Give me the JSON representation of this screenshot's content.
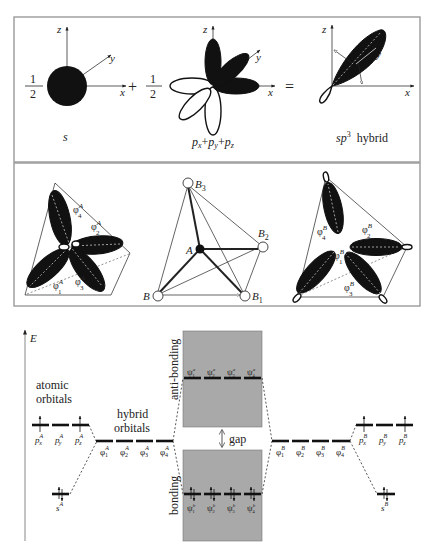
{
  "top_panel": {
    "terms": [
      {
        "coefficient_num": "1",
        "coefficient_den": "2",
        "label": "s"
      },
      {
        "operator": "+",
        "coefficient_num": "1",
        "coefficient_den": "2",
        "label_parts": [
          "p",
          "x",
          "+",
          "p",
          "y",
          "+",
          "p",
          "z"
        ]
      },
      {
        "operator": "=",
        "label": "sp",
        "label_sup": "3",
        "label_suffix": "hybrid"
      }
    ],
    "axes": {
      "x": "x",
      "y": "y",
      "z": "z"
    }
  },
  "middle_panel": {
    "left": {
      "labels": [
        {
          "sym": "φ",
          "sup": "A",
          "sub": "4"
        },
        {
          "sym": "φ",
          "sup": "A",
          "sub": "2"
        },
        {
          "sym": "φ",
          "sup": "A",
          "sub": "1"
        },
        {
          "sym": "φ",
          "sup": "A",
          "sub": "3"
        }
      ]
    },
    "center": {
      "atoms": [
        {
          "name": "B",
          "sub": "3"
        },
        {
          "name": "A",
          "sub": ""
        },
        {
          "name": "B",
          "sub": "2"
        },
        {
          "name": "B",
          "sub": ""
        },
        {
          "name": "B",
          "sub": "1"
        }
      ]
    },
    "right": {
      "labels": [
        {
          "sym": "φ",
          "sup": "B",
          "sub": "4"
        },
        {
          "sym": "φ",
          "sup": "B",
          "sub": "2"
        },
        {
          "sym": "φ",
          "sup": "B",
          "sub": "1"
        },
        {
          "sym": "φ",
          "sup": "B",
          "sub": "3"
        }
      ]
    }
  },
  "energy_diagram": {
    "axis_label": "E",
    "atomic_orbitals_label_1": "atomic",
    "atomic_orbitals_label_2": "orbitals",
    "hybrid_orbitals_label_1": "hybrid",
    "hybrid_orbitals_label_2": "orbitals",
    "anti_bonding_label": "anti-bonding",
    "bonding_label": "bonding",
    "gap_label": "gap",
    "atom_A": {
      "p_orbitals": [
        {
          "sym": "p",
          "sup": "A",
          "sub": "x",
          "electrons": "↑"
        },
        {
          "sym": "p",
          "sup": "A",
          "sub": "y",
          "electrons": ""
        },
        {
          "sym": "p",
          "sup": "A",
          "sub": "z",
          "electrons": "↑"
        }
      ],
      "s_orbital": {
        "sym": "s",
        "sup": "A",
        "electrons": "↑↓"
      },
      "hybrids": [
        {
          "sym": "φ",
          "sup": "A",
          "sub": "1"
        },
        {
          "sym": "φ",
          "sup": "A",
          "sub": "2"
        },
        {
          "sym": "φ",
          "sup": "A",
          "sub": "3"
        },
        {
          "sym": "φ",
          "sup": "A",
          "sub": "4"
        }
      ]
    },
    "atom_B": {
      "p_orbitals": [
        {
          "sym": "p",
          "sup": "B",
          "sub": "x",
          "electrons": "↑"
        },
        {
          "sym": "p",
          "sup": "B",
          "sub": "y",
          "electrons": ""
        },
        {
          "sym": "p",
          "sup": "B",
          "sub": "z",
          "electrons": "↑"
        }
      ],
      "s_orbital": {
        "sym": "s",
        "sup": "B",
        "electrons": "↑↓"
      },
      "hybrids": [
        {
          "sym": "φ",
          "sup": "B",
          "sub": "1"
        },
        {
          "sym": "φ",
          "sup": "B",
          "sub": "2"
        },
        {
          "sym": "φ",
          "sup": "B",
          "sub": "3"
        },
        {
          "sym": "φ",
          "sup": "B",
          "sub": "4"
        }
      ]
    },
    "anti_bonding_levels": [
      {
        "sym": "ψ",
        "sup": "a",
        "sub": "1"
      },
      {
        "sym": "ψ",
        "sup": "a",
        "sub": "2"
      },
      {
        "sym": "ψ",
        "sup": "a",
        "sub": "3"
      },
      {
        "sym": "ψ",
        "sup": "a",
        "sub": "4"
      }
    ],
    "bonding_levels": [
      {
        "sym": "ψ",
        "sup": "b",
        "sub": "1",
        "electrons": "↑↓"
      },
      {
        "sym": "ψ",
        "sup": "b",
        "sub": "2",
        "electrons": "↑↓"
      },
      {
        "sym": "ψ",
        "sup": "b",
        "sub": "3",
        "electrons": "↑↓"
      },
      {
        "sym": "ψ",
        "sup": "b",
        "sub": "4",
        "electrons": "↑↓"
      }
    ],
    "colors": {
      "band_fill": "#a9a9a9",
      "level": "#111111",
      "lobe": "#111111"
    }
  }
}
